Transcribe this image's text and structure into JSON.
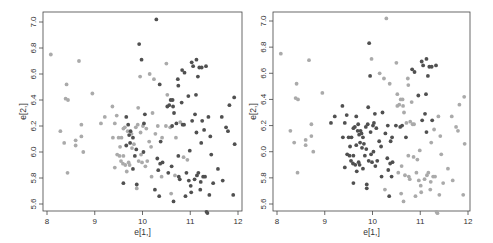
{
  "chart_data": [
    {
      "type": "scatter",
      "panel": "left",
      "xlabel": "e[1,]",
      "ylabel": "e[2,]",
      "xlim": [
        8,
        12
      ],
      "ylim": [
        5.6,
        7.0
      ],
      "x_ticks": [
        8,
        9,
        10,
        11,
        12
      ],
      "y_ticks": [
        "5.6",
        "5.8",
        "6.0",
        "6.2",
        "6.4",
        "6.6",
        "6.8",
        "7.0"
      ],
      "grid": false,
      "legend": null,
      "colors": {
        "dark": "#505050",
        "light": "#aaaaaa"
      },
      "coloring": "dark = points with higher e[1,] (right-side cluster); light = left/center points"
    },
    {
      "type": "scatter",
      "panel": "right",
      "xlabel": "e[1,]",
      "ylabel": "e[2,]",
      "xlim": [
        8,
        12
      ],
      "ylim": [
        5.6,
        7.0
      ],
      "x_ticks": [
        8,
        9,
        10,
        11,
        12
      ],
      "y_ticks": [
        "5.6",
        "5.8",
        "6.0",
        "6.2",
        "6.4",
        "6.6",
        "6.8",
        "7.0"
      ],
      "grid": false,
      "legend": null,
      "colors": {
        "dark": "#505050",
        "light": "#aaaaaa"
      },
      "coloring": "dark = center cluster and upper-right points; light = far-left and lower-right points"
    }
  ],
  "points": [
    {
      "x": 8.08,
      "y": 6.75,
      "L": 0,
      "R": 0
    },
    {
      "x": 8.28,
      "y": 6.16,
      "L": 0,
      "R": 0
    },
    {
      "x": 8.36,
      "y": 6.07,
      "L": 0,
      "R": 0
    },
    {
      "x": 8.41,
      "y": 6.52,
      "L": 0,
      "R": 0
    },
    {
      "x": 8.39,
      "y": 6.41,
      "L": 0,
      "R": 0
    },
    {
      "x": 8.44,
      "y": 6.4,
      "L": 0,
      "R": 0
    },
    {
      "x": 8.43,
      "y": 5.84,
      "L": 0,
      "R": 0
    },
    {
      "x": 8.6,
      "y": 6.09,
      "L": 0,
      "R": 0
    },
    {
      "x": 8.6,
      "y": 6.05,
      "L": 0,
      "R": 0
    },
    {
      "x": 8.67,
      "y": 6.7,
      "L": 0,
      "R": 0
    },
    {
      "x": 8.72,
      "y": 6.21,
      "L": 0,
      "R": 0
    },
    {
      "x": 8.72,
      "y": 6.12,
      "L": 0,
      "R": 0
    },
    {
      "x": 8.76,
      "y": 6.0,
      "L": 0,
      "R": 0
    },
    {
      "x": 8.95,
      "y": 6.45,
      "L": 0,
      "R": 0
    },
    {
      "x": 9.13,
      "y": 6.22,
      "L": 0,
      "R": 1
    },
    {
      "x": 9.21,
      "y": 6.27,
      "L": 0,
      "R": 1
    },
    {
      "x": 9.37,
      "y": 6.35,
      "L": 0,
      "R": 1
    },
    {
      "x": 9.38,
      "y": 6.11,
      "L": 0,
      "R": 1
    },
    {
      "x": 9.42,
      "y": 6.22,
      "L": 0,
      "R": 1
    },
    {
      "x": 9.42,
      "y": 5.88,
      "L": 0,
      "R": 1
    },
    {
      "x": 9.46,
      "y": 6.28,
      "L": 0,
      "R": 1
    },
    {
      "x": 9.47,
      "y": 5.98,
      "L": 0,
      "R": 1
    },
    {
      "x": 9.5,
      "y": 6.11,
      "L": 0,
      "R": 1
    },
    {
      "x": 9.52,
      "y": 5.97,
      "L": 0,
      "R": 1
    },
    {
      "x": 9.53,
      "y": 6.04,
      "L": 0,
      "R": 1
    },
    {
      "x": 9.55,
      "y": 5.93,
      "L": 0,
      "R": 1
    },
    {
      "x": 9.56,
      "y": 6.11,
      "L": 0,
      "R": 1
    },
    {
      "x": 9.59,
      "y": 5.91,
      "L": 0,
      "R": 1
    },
    {
      "x": 9.6,
      "y": 6.18,
      "L": 0,
      "R": 1
    },
    {
      "x": 9.6,
      "y": 5.97,
      "L": 0,
      "R": 1
    },
    {
      "x": 9.6,
      "y": 5.76,
      "L": 1,
      "R": 1
    },
    {
      "x": 9.63,
      "y": 6.19,
      "L": 0,
      "R": 1
    },
    {
      "x": 9.64,
      "y": 5.9,
      "L": 0,
      "R": 1
    },
    {
      "x": 9.66,
      "y": 6.27,
      "L": 1,
      "R": 1
    },
    {
      "x": 9.66,
      "y": 6.05,
      "L": 1,
      "R": 1
    },
    {
      "x": 9.67,
      "y": 5.85,
      "L": 0,
      "R": 1
    },
    {
      "x": 9.69,
      "y": 6.16,
      "L": 0,
      "R": 1
    },
    {
      "x": 9.7,
      "y": 6.21,
      "L": 1,
      "R": 1
    },
    {
      "x": 9.71,
      "y": 5.92,
      "L": 0,
      "R": 1
    },
    {
      "x": 9.72,
      "y": 6.13,
      "L": 1,
      "R": 1
    },
    {
      "x": 9.73,
      "y": 5.9,
      "L": 0,
      "R": 1
    },
    {
      "x": 9.74,
      "y": 6.07,
      "L": 1,
      "R": 1
    },
    {
      "x": 9.75,
      "y": 6.16,
      "L": 1,
      "R": 1
    },
    {
      "x": 9.77,
      "y": 6.14,
      "L": 0,
      "R": 1
    },
    {
      "x": 9.78,
      "y": 6.03,
      "L": 0,
      "R": 1
    },
    {
      "x": 9.8,
      "y": 6.11,
      "L": 1,
      "R": 1
    },
    {
      "x": 9.8,
      "y": 5.87,
      "L": 1,
      "R": 1
    },
    {
      "x": 9.82,
      "y": 6.06,
      "L": 0,
      "R": 1
    },
    {
      "x": 9.84,
      "y": 5.97,
      "L": 1,
      "R": 1
    },
    {
      "x": 9.86,
      "y": 6.19,
      "L": 0,
      "R": 1
    },
    {
      "x": 9.87,
      "y": 6.02,
      "L": 1,
      "R": 1
    },
    {
      "x": 9.88,
      "y": 5.75,
      "L": 1,
      "R": 1
    },
    {
      "x": 9.88,
      "y": 5.72,
      "L": 0,
      "R": 1
    },
    {
      "x": 9.9,
      "y": 6.21,
      "L": 0,
      "R": 1
    },
    {
      "x": 9.91,
      "y": 6.34,
      "L": 0,
      "R": 1
    },
    {
      "x": 9.92,
      "y": 5.93,
      "L": 0,
      "R": 1
    },
    {
      "x": 9.93,
      "y": 6.83,
      "L": 1,
      "R": 1
    },
    {
      "x": 9.95,
      "y": 6.58,
      "L": 0,
      "R": 1
    },
    {
      "x": 9.96,
      "y": 6.15,
      "L": 0,
      "R": 1
    },
    {
      "x": 9.97,
      "y": 5.98,
      "L": 0,
      "R": 1
    },
    {
      "x": 9.98,
      "y": 6.71,
      "L": 1,
      "R": 0
    },
    {
      "x": 9.99,
      "y": 5.92,
      "L": 0,
      "R": 1
    },
    {
      "x": 10.01,
      "y": 6.2,
      "L": 0,
      "R": 1
    },
    {
      "x": 10.02,
      "y": 6.0,
      "L": 1,
      "R": 1
    },
    {
      "x": 10.03,
      "y": 6.22,
      "L": 1,
      "R": 1
    },
    {
      "x": 10.05,
      "y": 6.29,
      "L": 1,
      "R": 1
    },
    {
      "x": 10.06,
      "y": 5.89,
      "L": 0,
      "R": 1
    },
    {
      "x": 10.08,
      "y": 6.18,
      "L": 0,
      "R": 1
    },
    {
      "x": 10.1,
      "y": 5.93,
      "L": 0,
      "R": 1
    },
    {
      "x": 10.14,
      "y": 6.08,
      "L": 0,
      "R": 1
    },
    {
      "x": 10.15,
      "y": 6.6,
      "L": 0,
      "R": 0
    },
    {
      "x": 10.18,
      "y": 6.04,
      "L": 0,
      "R": 1
    },
    {
      "x": 10.19,
      "y": 5.81,
      "L": 0,
      "R": 1
    },
    {
      "x": 10.21,
      "y": 6.3,
      "L": 0,
      "R": 1
    },
    {
      "x": 10.24,
      "y": 6.56,
      "L": 0,
      "R": 0
    },
    {
      "x": 10.26,
      "y": 5.71,
      "L": 1,
      "R": 0
    },
    {
      "x": 10.27,
      "y": 6.14,
      "L": 0,
      "R": 1
    },
    {
      "x": 10.29,
      "y": 7.02,
      "L": 1,
      "R": 0
    },
    {
      "x": 10.31,
      "y": 5.95,
      "L": 1,
      "R": 1
    },
    {
      "x": 10.32,
      "y": 6.2,
      "L": 0,
      "R": 1
    },
    {
      "x": 10.33,
      "y": 5.86,
      "L": 1,
      "R": 1
    },
    {
      "x": 10.35,
      "y": 5.66,
      "L": 1,
      "R": 1
    },
    {
      "x": 10.36,
      "y": 6.52,
      "L": 1,
      "R": 0
    },
    {
      "x": 10.37,
      "y": 5.91,
      "L": 1,
      "R": 1
    },
    {
      "x": 10.38,
      "y": 6.08,
      "L": 1,
      "R": 1
    },
    {
      "x": 10.4,
      "y": 5.81,
      "L": 0,
      "R": 1
    },
    {
      "x": 10.41,
      "y": 6.11,
      "L": 0,
      "R": 1
    },
    {
      "x": 10.42,
      "y": 5.92,
      "L": 1,
      "R": 1
    },
    {
      "x": 10.49,
      "y": 6.2,
      "L": 0,
      "R": 1
    },
    {
      "x": 10.5,
      "y": 6.68,
      "L": 0,
      "R": 0
    },
    {
      "x": 10.52,
      "y": 6.44,
      "L": 0,
      "R": 0
    },
    {
      "x": 10.52,
      "y": 6.35,
      "L": 1,
      "R": 0
    },
    {
      "x": 10.54,
      "y": 5.84,
      "L": 1,
      "R": 0
    },
    {
      "x": 10.56,
      "y": 6.36,
      "L": 1,
      "R": 0
    },
    {
      "x": 10.58,
      "y": 6.19,
      "L": 0,
      "R": 1
    },
    {
      "x": 10.59,
      "y": 6.4,
      "L": 1,
      "R": 0
    },
    {
      "x": 10.6,
      "y": 5.68,
      "L": 0,
      "R": 0
    },
    {
      "x": 10.61,
      "y": 5.89,
      "L": 1,
      "R": 0
    },
    {
      "x": 10.62,
      "y": 6.2,
      "L": 1,
      "R": 1
    },
    {
      "x": 10.63,
      "y": 6.4,
      "L": 1,
      "R": 0
    },
    {
      "x": 10.64,
      "y": 6.35,
      "L": 1,
      "R": 0
    },
    {
      "x": 10.65,
      "y": 5.62,
      "L": 1,
      "R": 0
    },
    {
      "x": 10.66,
      "y": 6.3,
      "L": 1,
      "R": 0
    },
    {
      "x": 10.68,
      "y": 5.82,
      "L": 0,
      "R": 0
    },
    {
      "x": 10.7,
      "y": 6.11,
      "L": 0,
      "R": 1
    },
    {
      "x": 10.71,
      "y": 6.22,
      "L": 1,
      "R": 0
    },
    {
      "x": 10.74,
      "y": 6.56,
      "L": 1,
      "R": 0
    },
    {
      "x": 10.75,
      "y": 6.51,
      "L": 1,
      "R": 0
    },
    {
      "x": 10.75,
      "y": 5.97,
      "L": 1,
      "R": 0
    },
    {
      "x": 10.76,
      "y": 5.81,
      "L": 1,
      "R": 0
    },
    {
      "x": 10.78,
      "y": 5.79,
      "L": 1,
      "R": 0
    },
    {
      "x": 10.79,
      "y": 6.23,
      "L": 0,
      "R": 0
    },
    {
      "x": 10.82,
      "y": 6.38,
      "L": 1,
      "R": 0
    },
    {
      "x": 10.83,
      "y": 6.63,
      "L": 1,
      "R": 1
    },
    {
      "x": 10.84,
      "y": 6.21,
      "L": 1,
      "R": 0
    },
    {
      "x": 10.86,
      "y": 5.96,
      "L": 0,
      "R": 0
    },
    {
      "x": 10.87,
      "y": 6.21,
      "L": 1,
      "R": 0
    },
    {
      "x": 10.88,
      "y": 6.61,
      "L": 1,
      "R": 1
    },
    {
      "x": 10.9,
      "y": 5.66,
      "L": 1,
      "R": 0
    },
    {
      "x": 10.92,
      "y": 5.84,
      "L": 1,
      "R": 0
    },
    {
      "x": 10.94,
      "y": 5.94,
      "L": 0,
      "R": 0
    },
    {
      "x": 10.96,
      "y": 6.43,
      "L": 1,
      "R": 1
    },
    {
      "x": 10.97,
      "y": 5.78,
      "L": 1,
      "R": 0
    },
    {
      "x": 10.99,
      "y": 6.01,
      "L": 1,
      "R": 0
    },
    {
      "x": 11.01,
      "y": 5.74,
      "L": 1,
      "R": 0
    },
    {
      "x": 11.02,
      "y": 5.69,
      "L": 1,
      "R": 0
    },
    {
      "x": 11.03,
      "y": 6.69,
      "L": 1,
      "R": 1
    },
    {
      "x": 11.04,
      "y": 6.24,
      "L": 1,
      "R": 1
    },
    {
      "x": 11.06,
      "y": 6.66,
      "L": 1,
      "R": 1
    },
    {
      "x": 11.09,
      "y": 5.79,
      "L": 1,
      "R": 0
    },
    {
      "x": 11.1,
      "y": 6.29,
      "L": 1,
      "R": 1
    },
    {
      "x": 11.12,
      "y": 6.44,
      "L": 1,
      "R": 1
    },
    {
      "x": 11.13,
      "y": 6.71,
      "L": 1,
      "R": 1
    },
    {
      "x": 11.13,
      "y": 6.15,
      "L": 1,
      "R": 1
    },
    {
      "x": 11.14,
      "y": 5.82,
      "L": 1,
      "R": 0
    },
    {
      "x": 11.16,
      "y": 6.58,
      "L": 1,
      "R": 1
    },
    {
      "x": 11.17,
      "y": 5.84,
      "L": 1,
      "R": 0
    },
    {
      "x": 11.19,
      "y": 6.65,
      "L": 1,
      "R": 1
    },
    {
      "x": 11.21,
      "y": 5.71,
      "L": 1,
      "R": 0
    },
    {
      "x": 11.22,
      "y": 5.77,
      "L": 1,
      "R": 0
    },
    {
      "x": 11.23,
      "y": 6.07,
      "L": 1,
      "R": 0
    },
    {
      "x": 11.24,
      "y": 6.65,
      "L": 1,
      "R": 1
    },
    {
      "x": 11.25,
      "y": 6.24,
      "L": 1,
      "R": 1
    },
    {
      "x": 11.27,
      "y": 5.81,
      "L": 1,
      "R": 0
    },
    {
      "x": 11.29,
      "y": 6.17,
      "L": 1,
      "R": 0
    },
    {
      "x": 11.31,
      "y": 5.81,
      "L": 1,
      "R": 0
    },
    {
      "x": 11.33,
      "y": 6.66,
      "L": 1,
      "R": 1
    },
    {
      "x": 11.34,
      "y": 5.54,
      "L": 1,
      "R": 0
    },
    {
      "x": 11.36,
      "y": 5.53,
      "L": 1,
      "R": 0
    },
    {
      "x": 11.38,
      "y": 6.27,
      "L": 1,
      "R": 0
    },
    {
      "x": 11.4,
      "y": 5.67,
      "L": 1,
      "R": 0
    },
    {
      "x": 11.42,
      "y": 6.12,
      "L": 1,
      "R": 0
    },
    {
      "x": 11.44,
      "y": 5.98,
      "L": 1,
      "R": 0
    },
    {
      "x": 11.48,
      "y": 5.76,
      "L": 1,
      "R": 0
    },
    {
      "x": 11.58,
      "y": 5.87,
      "L": 1,
      "R": 0
    },
    {
      "x": 11.66,
      "y": 6.27,
      "L": 1,
      "R": 0
    },
    {
      "x": 11.68,
      "y": 5.78,
      "L": 1,
      "R": 0
    },
    {
      "x": 11.75,
      "y": 6.19,
      "L": 1,
      "R": 0
    },
    {
      "x": 11.79,
      "y": 6.16,
      "L": 1,
      "R": 0
    },
    {
      "x": 11.82,
      "y": 6.36,
      "L": 1,
      "R": 0
    },
    {
      "x": 11.9,
      "y": 5.67,
      "L": 1,
      "R": 0
    },
    {
      "x": 11.92,
      "y": 6.42,
      "L": 1,
      "R": 0
    },
    {
      "x": 11.93,
      "y": 6.06,
      "L": 1,
      "R": 0
    }
  ],
  "axes": {
    "xlabel": "e[1,]",
    "ylabel": "e[2,]"
  }
}
